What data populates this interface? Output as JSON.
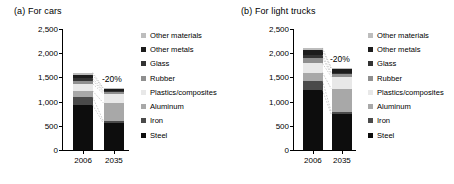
{
  "figure": {
    "panels": [
      {
        "id": "a",
        "title": "(a) For cars",
        "ylabel": "Mass breakdown (kg)",
        "reduction_label": "-20%"
      },
      {
        "id": "b",
        "title": "(b) For light trucks",
        "ylabel": "Mass breakdown (kg)",
        "reduction_label": "-20%"
      }
    ]
  },
  "axis": {
    "ticks": [
      "2,500",
      "2,000",
      "1,500",
      "1,000",
      "500",
      "0"
    ],
    "tick_values": [
      2500,
      2000,
      1500,
      1000,
      500,
      0
    ],
    "ymin": 0,
    "ymax": 2500
  },
  "legend": {
    "items": [
      {
        "label": "Other materials",
        "color": "#bdbdbd"
      },
      {
        "label": "Other metals",
        "color": "#1c1c1c"
      },
      {
        "label": "Glass",
        "color": "#333333"
      },
      {
        "label": "Rubber",
        "color": "#8f8f8f"
      },
      {
        "label": "Plastics/composites",
        "color": "#e8e8e8"
      },
      {
        "label": "Aluminum",
        "color": "#a8a8a8"
      },
      {
        "label": "Iron",
        "color": "#4a4a4a"
      },
      {
        "label": "Steel",
        "color": "#0d0d0d"
      }
    ]
  },
  "chart_data": {
    "type": "bar",
    "subtype": "stacked",
    "xlabel": "",
    "ylabel": "Mass breakdown (kg)",
    "ylim": [
      0,
      2500
    ],
    "ytick_values": [
      0,
      500,
      1000,
      1500,
      2000,
      2500
    ],
    "ytick_labels": [
      "0",
      "500",
      "1,000",
      "1,500",
      "2,000",
      "2,500"
    ],
    "grid": false,
    "legend_position": "right",
    "categories": [
      "2006",
      "2035"
    ],
    "panels": [
      {
        "id": "a",
        "title": "(a) For cars",
        "annotation": "-20%",
        "totals": [
          1600,
          1280
        ],
        "series": [
          {
            "name": "Steel",
            "color": "#0d0d0d",
            "values": [
              930,
              555
            ]
          },
          {
            "name": "Iron",
            "color": "#4a4a4a",
            "values": [
              165,
              45
            ]
          },
          {
            "name": "Aluminum",
            "color": "#a8a8a8",
            "values": [
              125,
              375
            ]
          },
          {
            "name": "Plastics/composites",
            "color": "#e8e8e8",
            "values": [
              150,
              190
            ]
          },
          {
            "name": "Rubber",
            "color": "#8f8f8f",
            "values": [
              65,
              35
            ]
          },
          {
            "name": "Glass",
            "color": "#333333",
            "values": [
              45,
              25
            ]
          },
          {
            "name": "Other metals",
            "color": "#1c1c1c",
            "values": [
              75,
              35
            ]
          },
          {
            "name": "Other materials",
            "color": "#bdbdbd",
            "values": [
              45,
              20
            ]
          }
        ]
      },
      {
        "id": "b",
        "title": "(b) For light trucks",
        "annotation": "-20%",
        "totals": [
          2110,
          1700
        ],
        "series": [
          {
            "name": "Steel",
            "color": "#0d0d0d",
            "values": [
              1240,
              735
            ]
          },
          {
            "name": "Iron",
            "color": "#4a4a4a",
            "values": [
              195,
              50
            ]
          },
          {
            "name": "Aluminum",
            "color": "#a8a8a8",
            "values": [
              165,
              480
            ]
          },
          {
            "name": "Plastics/composites",
            "color": "#e8e8e8",
            "values": [
              190,
              250
            ]
          },
          {
            "name": "Rubber",
            "color": "#8f8f8f",
            "values": [
              110,
              50
            ]
          },
          {
            "name": "Glass",
            "color": "#333333",
            "values": [
              60,
              35
            ]
          },
          {
            "name": "Other metals",
            "color": "#1c1c1c",
            "values": [
              100,
              70
            ]
          },
          {
            "name": "Other materials",
            "color": "#bdbdbd",
            "values": [
              50,
              30
            ]
          }
        ]
      }
    ]
  }
}
